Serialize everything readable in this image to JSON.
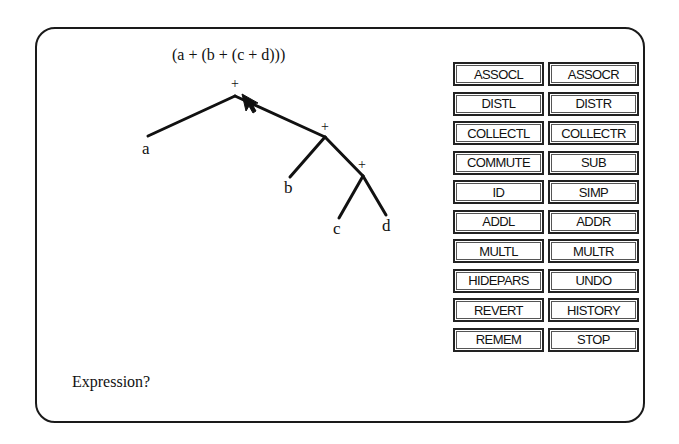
{
  "expression": "(a + (b + (c + d)))",
  "tree": {
    "operators": [
      "+",
      "+",
      "+"
    ],
    "leaves": [
      "a",
      "b",
      "c",
      "d"
    ]
  },
  "buttons": [
    {
      "label": "ASSOCL"
    },
    {
      "label": "ASSOCR"
    },
    {
      "label": "DISTL"
    },
    {
      "label": "DISTR"
    },
    {
      "label": "COLLECTL"
    },
    {
      "label": "COLLECTR"
    },
    {
      "label": "COMMUTE"
    },
    {
      "label": "SUB"
    },
    {
      "label": "ID"
    },
    {
      "label": "SIMP"
    },
    {
      "label": "ADDL"
    },
    {
      "label": "ADDR"
    },
    {
      "label": "MULTL"
    },
    {
      "label": "MULTR"
    },
    {
      "label": "HIDEPARS"
    },
    {
      "label": "UNDO"
    },
    {
      "label": "REVERT"
    },
    {
      "label": "HISTORY"
    },
    {
      "label": "REMEM"
    },
    {
      "label": "STOP"
    }
  ],
  "prompt": "Expression?",
  "icons": {
    "cursor": "arrow-cursor-icon"
  }
}
